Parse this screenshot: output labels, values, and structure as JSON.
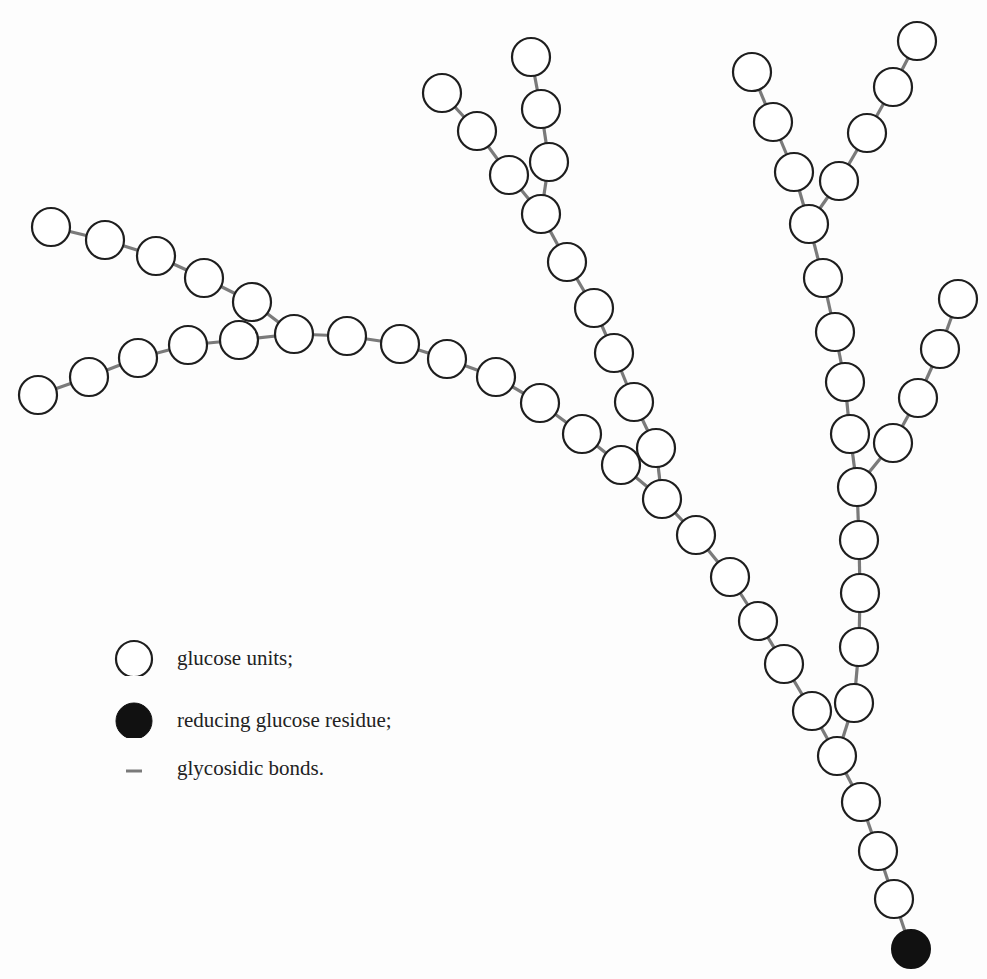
{
  "figure": {
    "colors": {
      "background": "#fdfdfd",
      "unit_fill": "#ffffff",
      "unit_stroke": "#1e1e1e",
      "reducing_fill": "#111111",
      "bond": "#7a7a7a"
    },
    "radius": 19,
    "reducing_end": [
      911,
      949
    ],
    "chains": [
      {
        "name": "main-stem",
        "points": [
          [
            911,
            949
          ],
          [
            894,
            899
          ],
          [
            878,
            851
          ],
          [
            861,
            802
          ],
          [
            837,
            756
          ]
        ]
      },
      {
        "name": "left-arm",
        "points": [
          [
            837,
            756
          ],
          [
            812,
            711
          ],
          [
            784,
            664
          ],
          [
            758,
            621
          ],
          [
            730,
            577
          ],
          [
            696,
            535
          ],
          [
            662,
            499
          ]
        ]
      },
      {
        "name": "long-left-chain",
        "points": [
          [
            662,
            499
          ],
          [
            621,
            465
          ],
          [
            582,
            434
          ],
          [
            540,
            403
          ],
          [
            496,
            377
          ],
          [
            447,
            359
          ],
          [
            400,
            344
          ],
          [
            347,
            336
          ],
          [
            294,
            334
          ]
        ]
      },
      {
        "name": "far-left-upper-branch",
        "points": [
          [
            294,
            334
          ],
          [
            252,
            302
          ],
          [
            204,
            278
          ],
          [
            156,
            256
          ],
          [
            105,
            240
          ],
          [
            51,
            227
          ]
        ]
      },
      {
        "name": "far-left-lower-branch",
        "points": [
          [
            294,
            334
          ],
          [
            239,
            340
          ],
          [
            188,
            345
          ],
          [
            138,
            358
          ],
          [
            89,
            377
          ],
          [
            38,
            395
          ]
        ]
      },
      {
        "name": "middle-upward-chain",
        "points": [
          [
            662,
            499
          ],
          [
            656,
            448
          ],
          [
            634,
            402
          ],
          [
            614,
            353
          ],
          [
            594,
            308
          ],
          [
            567,
            262
          ],
          [
            541,
            214
          ]
        ]
      },
      {
        "name": "middle-top-left-branch",
        "points": [
          [
            541,
            214
          ],
          [
            509,
            175
          ],
          [
            477,
            131
          ],
          [
            442,
            93
          ]
        ]
      },
      {
        "name": "middle-top-right-branch",
        "points": [
          [
            541,
            214
          ],
          [
            549,
            162
          ],
          [
            541,
            109
          ],
          [
            531,
            57
          ]
        ]
      },
      {
        "name": "right-vertical-chain",
        "points": [
          [
            837,
            756
          ],
          [
            854,
            703
          ],
          [
            859,
            647
          ],
          [
            860,
            593
          ],
          [
            859,
            540
          ],
          [
            857,
            487
          ]
        ]
      },
      {
        "name": "right-upper-chain",
        "points": [
          [
            857,
            487
          ],
          [
            850,
            434
          ],
          [
            845,
            382
          ],
          [
            835,
            332
          ],
          [
            823,
            278
          ],
          [
            809,
            224
          ]
        ]
      },
      {
        "name": "right-side-branch",
        "points": [
          [
            857,
            487
          ],
          [
            893,
            443
          ],
          [
            918,
            398
          ],
          [
            940,
            349
          ],
          [
            958,
            299
          ]
        ]
      },
      {
        "name": "top-right-left-branch",
        "points": [
          [
            809,
            224
          ],
          [
            794,
            172
          ],
          [
            773,
            122
          ],
          [
            752,
            72
          ]
        ]
      },
      {
        "name": "top-right-right-branch",
        "points": [
          [
            809,
            224
          ],
          [
            839,
            181
          ],
          [
            867,
            133
          ],
          [
            893,
            87
          ],
          [
            917,
            41
          ]
        ]
      }
    ]
  },
  "legend": {
    "items": [
      {
        "symbol": "open-circle",
        "label": "glucose units;"
      },
      {
        "symbol": "filled-circle",
        "label": "reducing glucose residue;"
      },
      {
        "symbol": "dash",
        "label": "glycosidic bonds."
      }
    ]
  }
}
